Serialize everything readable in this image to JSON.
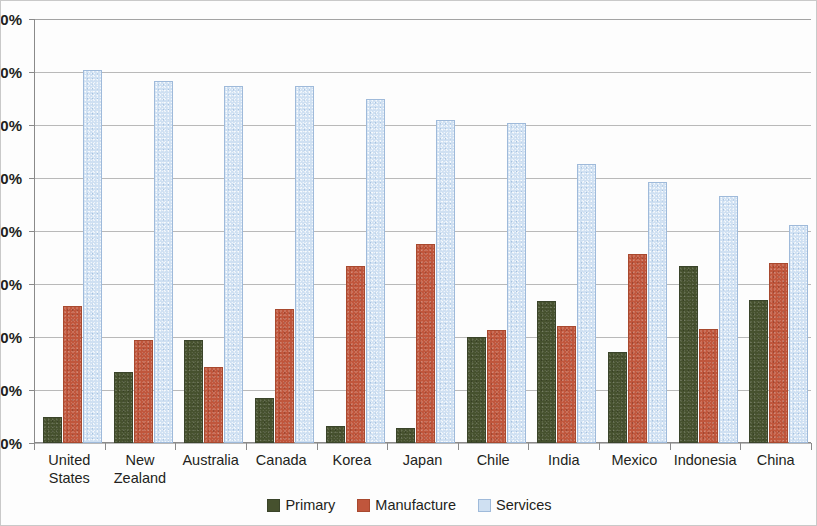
{
  "chart_data": {
    "type": "bar",
    "title": "",
    "subtitle": "",
    "xlabel": "",
    "ylabel": "",
    "ylim": [
      0,
      80
    ],
    "ytick_labels": [
      "0%",
      "10%",
      "20%",
      "30%",
      "40%",
      "50%",
      "60%",
      "70%",
      "80%"
    ],
    "ytick_values": [
      0,
      10,
      20,
      30,
      40,
      50,
      60,
      70,
      80
    ],
    "grid": true,
    "legend_position": "bottom",
    "categories": [
      "United\nStates",
      "New\nZealand",
      "Australia",
      "Canada",
      "Korea",
      "Japan",
      "Chile",
      "India",
      "Mexico",
      "Indonesia",
      "China"
    ],
    "series": [
      {
        "name": "Primary",
        "color": "#46512e",
        "values": [
          4.5,
          13.0,
          19.0,
          8.2,
          2.8,
          2.5,
          19.6,
          26.5,
          16.8,
          33.0,
          26.6
        ]
      },
      {
        "name": "Manufacture",
        "color": "#c0563c",
        "values": [
          25.5,
          19.0,
          14.0,
          25.0,
          33.1,
          37.1,
          21.0,
          21.7,
          35.2,
          21.2,
          33.5
        ]
      },
      {
        "name": "Services",
        "color": "#cfe0f2",
        "values": [
          70.0,
          68.0,
          67.0,
          67.0,
          64.5,
          60.5,
          60.0,
          52.3,
          48.8,
          46.3,
          40.7
        ]
      }
    ]
  },
  "legend": {
    "items": [
      {
        "label": "Primary",
        "key": "primary"
      },
      {
        "label": "Manufacture",
        "key": "manufacture"
      },
      {
        "label": "Services",
        "key": "services"
      }
    ]
  }
}
